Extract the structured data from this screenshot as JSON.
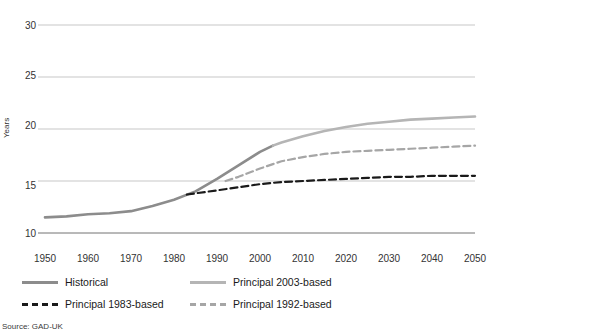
{
  "chart_data": {
    "type": "line",
    "title": "",
    "xlabel": "",
    "ylabel": "Years",
    "xlim": [
      1950,
      2050
    ],
    "ylim": [
      10,
      30
    ],
    "ygrid": true,
    "xgrid": false,
    "yticks": [
      10,
      15,
      20,
      25,
      30
    ],
    "xticks": [
      1950,
      1960,
      1970,
      1980,
      1990,
      2000,
      2010,
      2020,
      2030,
      2040,
      2050
    ],
    "legend_position": "bottom",
    "series": [
      {
        "name": "Historical",
        "color": "#8c8c8c",
        "style": "solid",
        "width": 2.6,
        "x": [
          1950,
          1955,
          1960,
          1965,
          1970,
          1975,
          1980,
          1985,
          1990,
          1995,
          2000,
          2003
        ],
        "values": [
          11.5,
          11.6,
          11.8,
          11.9,
          12.1,
          12.6,
          13.2,
          14.0,
          15.2,
          16.5,
          17.8,
          18.4
        ]
      },
      {
        "name": "Principal 1983-based",
        "color": "#1a1a1a",
        "style": "dashed",
        "width": 2.2,
        "x": [
          1983,
          1990,
          1995,
          2000,
          2005,
          2010,
          2015,
          2020,
          2025,
          2030,
          2035,
          2040,
          2045,
          2050
        ],
        "values": [
          13.7,
          14.1,
          14.4,
          14.7,
          14.9,
          15.0,
          15.1,
          15.2,
          15.3,
          15.4,
          15.4,
          15.5,
          15.5,
          15.5
        ]
      },
      {
        "name": "Principal 1992-based",
        "color": "#a6a6a6",
        "style": "dashed",
        "width": 2.2,
        "x": [
          1992,
          1995,
          2000,
          2005,
          2010,
          2015,
          2020,
          2025,
          2030,
          2035,
          2040,
          2045,
          2050
        ],
        "values": [
          15.0,
          15.4,
          16.2,
          16.9,
          17.3,
          17.6,
          17.8,
          17.9,
          18.0,
          18.1,
          18.2,
          18.3,
          18.4
        ]
      },
      {
        "name": "Principal 2003-based",
        "color": "#b5b5b5",
        "style": "solid",
        "width": 2.6,
        "x": [
          2003,
          2005,
          2010,
          2015,
          2020,
          2025,
          2030,
          2035,
          2040,
          2045,
          2050
        ],
        "values": [
          18.4,
          18.7,
          19.3,
          19.8,
          20.2,
          20.5,
          20.7,
          20.9,
          21.0,
          21.1,
          21.2
        ]
      }
    ]
  },
  "axis": {
    "ylabel": "Years",
    "yticks": [
      "30",
      "25",
      "20",
      "15",
      "10"
    ],
    "xticks": [
      "1950",
      "1960",
      "1970",
      "1980",
      "1990",
      "2000",
      "2010",
      "2020",
      "2030",
      "2040",
      "2050"
    ]
  },
  "legend": {
    "items": [
      {
        "label": "Historical",
        "color": "#8c8c8c",
        "style": "solid"
      },
      {
        "label": "Principal 2003-based",
        "color": "#b5b5b5",
        "style": "solid"
      },
      {
        "label": "Principal 1983-based",
        "color": "#1a1a1a",
        "style": "dashed"
      },
      {
        "label": "Principal 1992-based",
        "color": "#a6a6a6",
        "style": "dashed"
      }
    ]
  },
  "footer": {
    "source": "Source:  GAD-UK"
  }
}
